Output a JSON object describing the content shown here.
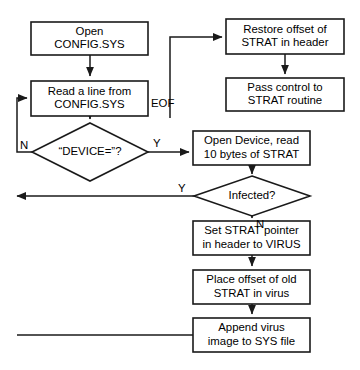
{
  "diagram": {
    "type": "flowchart",
    "background_color": "#ffffff",
    "line_color": "#1a1a1a",
    "text_color": "#000000",
    "nodes": [
      {
        "id": "open_config",
        "shape": "process",
        "lines": [
          "Open",
          "CONFIG.SYS"
        ],
        "x": 31,
        "y": 22,
        "w": 117,
        "h": 33
      },
      {
        "id": "read_line",
        "shape": "process",
        "lines": [
          "Read a line from",
          "CONFIG.SYS"
        ],
        "x": 31,
        "y": 81,
        "w": 117,
        "h": 35
      },
      {
        "id": "device_test",
        "shape": "decision",
        "lines": [
          "“DEVICE=”?"
        ],
        "cx": 90,
        "cy": 152,
        "rx": 58,
        "ry": 29
      },
      {
        "id": "restore_offset",
        "shape": "process",
        "lines": [
          "Restore offset of",
          "STRAT in header"
        ],
        "x": 226,
        "y": 19,
        "w": 118,
        "h": 35
      },
      {
        "id": "pass_control",
        "shape": "process",
        "lines": [
          "Pass control to",
          "STRAT routine"
        ],
        "x": 226,
        "y": 78,
        "w": 118,
        "h": 33
      },
      {
        "id": "open_device",
        "shape": "process",
        "lines": [
          "Open Device, read",
          "10 bytes of STRAT"
        ],
        "x": 193,
        "y": 131,
        "w": 117,
        "h": 34
      },
      {
        "id": "infected_test",
        "shape": "decision",
        "lines": [
          "Infected?"
        ],
        "cx": 252,
        "cy": 196,
        "rx": 58,
        "ry": 20
      },
      {
        "id": "set_strat",
        "shape": "process",
        "lines": [
          "Set STRAT pointer",
          "in header to VIRUS"
        ],
        "x": 193,
        "y": 221,
        "w": 117,
        "h": 34
      },
      {
        "id": "place_offset",
        "shape": "process",
        "lines": [
          "Place offset of old",
          "STRAT in virus"
        ],
        "x": 193,
        "y": 270,
        "w": 117,
        "h": 34
      },
      {
        "id": "append_virus",
        "shape": "process",
        "lines": [
          "Append virus",
          "image to SYS file"
        ],
        "x": 193,
        "y": 318,
        "w": 117,
        "h": 34
      }
    ],
    "edge_labels": [
      {
        "id": "eof_label",
        "text": "EOF",
        "x": 151,
        "y": 104
      },
      {
        "id": "device_no_label",
        "text": "N",
        "x": 20,
        "y": 146
      },
      {
        "id": "device_yes_label",
        "text": "Y",
        "x": 153,
        "y": 144
      },
      {
        "id": "infected_yes_label",
        "text": "Y",
        "x": 178,
        "y": 189
      },
      {
        "id": "infected_no_label",
        "text": "N",
        "x": 256,
        "y": 225
      }
    ],
    "edges": [
      {
        "id": "edge-open-to-read",
        "path": "M 90 55 L 90 76",
        "arrow": true
      },
      {
        "id": "edge-read-eof-to-restore",
        "path": "M 170 118 L 170 37 L 222 37",
        "arrow": true
      },
      {
        "id": "edge-restore-to-pass",
        "path": "M 285 54 L 285 74",
        "arrow": true
      },
      {
        "id": "edge-read-to-device",
        "path": "M 90 116 L 90 119",
        "arrow": true
      },
      {
        "id": "edge-device-yes-to-open-device",
        "path": "M 148 152 L 189 152",
        "arrow": true
      },
      {
        "id": "edge-device-no-loop",
        "path": "M 33 152 L 17 152 L 17 98 L 27 98",
        "arrow": true
      },
      {
        "id": "edge-open-device-to-infected",
        "path": "M 252 165 L 252 174",
        "arrow": true
      },
      {
        "id": "edge-infected-yes-loop",
        "path": "M 195 196 L 17 196",
        "arrow": true
      },
      {
        "id": "edge-infected-no-to-set",
        "path": "M 252 216 L 252 218",
        "arrow": true
      },
      {
        "id": "edge-set-to-place",
        "path": "M 252 255 L 252 266",
        "arrow": true
      },
      {
        "id": "edge-place-to-append",
        "path": "M 252 304 L 252 314",
        "arrow": true
      },
      {
        "id": "edge-append-loop-back",
        "path": "M 193 335 L 17 335",
        "arrow": false
      }
    ]
  }
}
